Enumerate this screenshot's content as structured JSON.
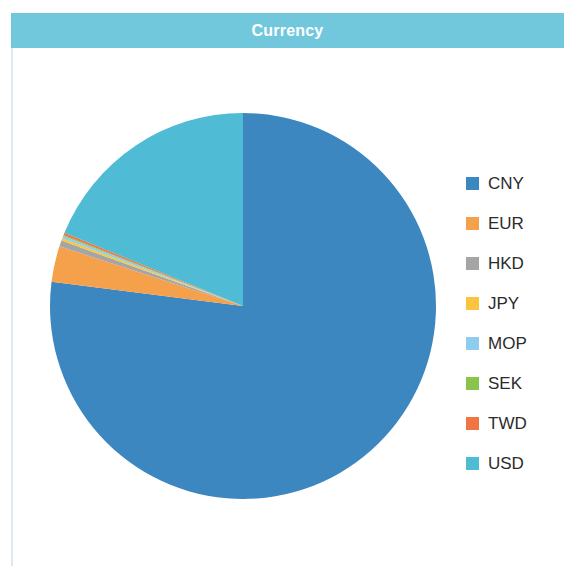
{
  "header": {
    "title": "Currency",
    "band_color": "#71c8dd",
    "title_color": "#ffffff"
  },
  "legend": {
    "position": "right",
    "items": [
      {
        "label": "CNY",
        "color": "#3c87c0"
      },
      {
        "label": "EUR",
        "color": "#f5a04b"
      },
      {
        "label": "HKD",
        "color": "#a5a5a5"
      },
      {
        "label": "JPY",
        "color": "#fbc43f"
      },
      {
        "label": "MOP",
        "color": "#8ecdf0"
      },
      {
        "label": "SEK",
        "color": "#8ac44c"
      },
      {
        "label": "TWD",
        "color": "#ef7642"
      },
      {
        "label": "USD",
        "color": "#4fbbd4"
      }
    ]
  },
  "chart_data": {
    "type": "pie",
    "title": "Currency",
    "xlabel": "",
    "ylabel": "",
    "legend_position": "right",
    "start_angle_deg": 0,
    "direction": "clockwise",
    "categories": [
      "CNY",
      "EUR",
      "HKD",
      "JPY",
      "MOP",
      "SEK",
      "TWD",
      "USD"
    ],
    "values": [
      77.0,
      3.0,
      0.5,
      0.2,
      0.2,
      0.1,
      0.2,
      18.8
    ],
    "colors": [
      "#3c87c0",
      "#f5a04b",
      "#a5a5a5",
      "#fbc43f",
      "#8ecdf0",
      "#8ac44c",
      "#ef7642",
      "#4fbbd4"
    ],
    "slices": [
      {
        "name": "CNY",
        "value": 77.0,
        "color": "#3c87c0"
      },
      {
        "name": "EUR",
        "value": 3.0,
        "color": "#f5a04b"
      },
      {
        "name": "HKD",
        "value": 0.5,
        "color": "#a5a5a5"
      },
      {
        "name": "JPY",
        "value": 0.2,
        "color": "#fbc43f"
      },
      {
        "name": "MOP",
        "value": 0.2,
        "color": "#8ecdf0"
      },
      {
        "name": "SEK",
        "value": 0.1,
        "color": "#8ac44c"
      },
      {
        "name": "TWD",
        "value": 0.2,
        "color": "#ef7642"
      },
      {
        "name": "USD",
        "value": 18.8,
        "color": "#4fbbd4"
      }
    ]
  }
}
